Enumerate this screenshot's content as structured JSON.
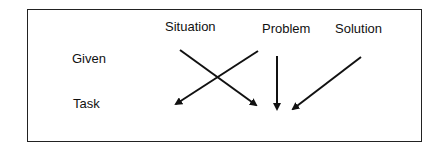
{
  "diagram": {
    "columns": [
      "Situation",
      "Problem",
      "Solution"
    ],
    "rows": [
      "Given",
      "Task"
    ],
    "arrows": [
      {
        "from": "Situation (Given)",
        "to": "Problem (Task)"
      },
      {
        "from": "Problem (Given)",
        "to": "Situation (Task)"
      },
      {
        "from": "Problem (Given)",
        "to": "Problem (Task)"
      },
      {
        "from": "Solution (Given)",
        "to": "Problem (Task)"
      }
    ]
  }
}
